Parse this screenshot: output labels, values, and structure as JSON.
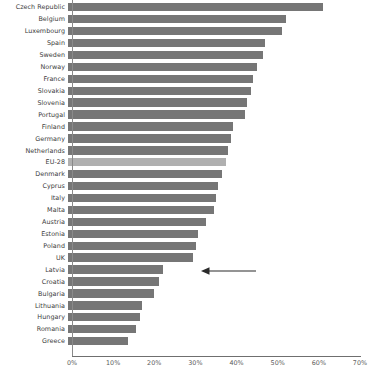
{
  "chart_data": {
    "type": "bar",
    "orientation": "horizontal",
    "title": "",
    "subtitle": "",
    "xlabel": "",
    "ylabel": "",
    "xlim": [
      0,
      70
    ],
    "xtick_labels": [
      "0%",
      "10%",
      "20%",
      "30%",
      "40%",
      "50%",
      "60%",
      "70%"
    ],
    "xtick_values": [
      0,
      10,
      20,
      30,
      40,
      50,
      60,
      70
    ],
    "grid": false,
    "legend": "none",
    "value_suffix": "%",
    "bar_color": "#767676",
    "highlight_color": "#b0b0b0",
    "highlight_category": "EU-28",
    "categories": [
      "Czech Republic",
      "Belgium",
      "Luxembourg",
      "Spain",
      "Sweden",
      "Norway",
      "France",
      "Slovakia",
      "Slovenia",
      "Portugal",
      "Finland",
      "Germany",
      "Netherlands",
      "EU-28",
      "Denmark",
      "Cyprus",
      "Italy",
      "Malta",
      "Austria",
      "Estonia",
      "Poland",
      "UK",
      "Latvia",
      "Croatia",
      "Bulgaria",
      "Lithuania",
      "Hungary",
      "Romania",
      "Greece"
    ],
    "values": [
      62.0,
      53.0,
      52.0,
      48.0,
      47.5,
      46.0,
      45.0,
      44.5,
      43.5,
      43.0,
      40.0,
      39.5,
      39.0,
      38.5,
      37.5,
      36.5,
      36.0,
      35.5,
      33.5,
      31.5,
      31.0,
      30.5,
      23.0,
      22.0,
      21.0,
      18.0,
      17.5,
      16.5,
      14.5
    ],
    "annotations": [
      {
        "name": "uk-arrow",
        "type": "arrow",
        "points_at_category": "UK",
        "direction": "left",
        "color": "#2b2b2b"
      }
    ]
  }
}
